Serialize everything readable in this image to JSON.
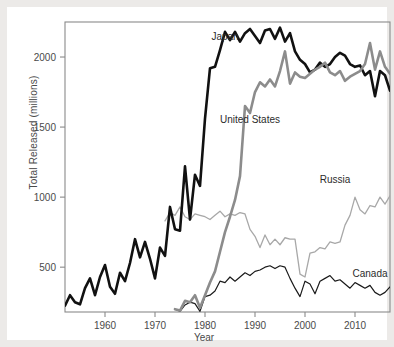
{
  "chart_data": {
    "type": "line",
    "title": "",
    "xlabel": "Year",
    "ylabel": "Total Released (millions)",
    "xlim": [
      1952,
      2017
    ],
    "ylim": [
      180,
      2250
    ],
    "xticks": [
      1960,
      1970,
      1980,
      1990,
      2000,
      2010
    ],
    "xtick_labels": [
      "1960",
      "1970",
      "1980",
      "1990",
      "2000",
      "2010"
    ],
    "yticks": [
      500,
      1000,
      1500,
      2000
    ],
    "ytick_labels": [
      "500",
      "1000",
      "1500",
      "2000"
    ],
    "grid": false,
    "legend_position": "inline-annotations",
    "series": [
      {
        "name": "Japan",
        "color": "#111111",
        "width": 2.6,
        "label_x": 1984,
        "label_y": 2120,
        "x": [
          1952,
          1953,
          1954,
          1955,
          1956,
          1957,
          1958,
          1959,
          1960,
          1961,
          1962,
          1963,
          1964,
          1965,
          1966,
          1967,
          1968,
          1969,
          1970,
          1971,
          1972,
          1973,
          1974,
          1975,
          1976,
          1977,
          1978,
          1979,
          1980,
          1981,
          1982,
          1983,
          1984,
          1985,
          1986,
          1987,
          1988,
          1989,
          1990,
          1991,
          1992,
          1993,
          1994,
          1995,
          1996,
          1997,
          1998,
          1999,
          2000,
          2001,
          2002,
          2003,
          2004,
          2005,
          2006,
          2007,
          2008,
          2009,
          2010,
          2011,
          2012,
          2013,
          2014,
          2015,
          2016,
          2017
        ],
        "y": [
          225,
          300,
          250,
          235,
          350,
          420,
          300,
          430,
          515,
          360,
          310,
          460,
          400,
          530,
          700,
          570,
          680,
          560,
          420,
          640,
          580,
          930,
          770,
          760,
          1220,
          840,
          1160,
          1080,
          1560,
          1920,
          1930,
          2050,
          2180,
          2120,
          2180,
          2110,
          2170,
          2200,
          2150,
          2100,
          2190,
          2200,
          2130,
          2210,
          2110,
          2170,
          2040,
          1980,
          1950,
          1890,
          1910,
          1960,
          1930,
          1950,
          2000,
          2030,
          2010,
          1950,
          1930,
          1940,
          1870,
          1900,
          1720,
          1900,
          1870,
          1760
        ]
      },
      {
        "name": "United States",
        "color": "#8c8c8c",
        "width": 2.6,
        "label_x": 1989,
        "label_y": 1530,
        "x": [
          1974,
          1975,
          1976,
          1977,
          1978,
          1979,
          1980,
          1981,
          1982,
          1983,
          1984,
          1985,
          1986,
          1987,
          1988,
          1989,
          1990,
          1991,
          1992,
          1993,
          1994,
          1995,
          1996,
          1997,
          1998,
          1999,
          2000,
          2001,
          2002,
          2003,
          2004,
          2005,
          2006,
          2007,
          2008,
          2009,
          2010,
          2011,
          2012,
          2013,
          2014,
          2015,
          2016,
          2017
        ],
        "y": [
          200,
          190,
          260,
          250,
          300,
          210,
          300,
          390,
          470,
          610,
          750,
          860,
          980,
          1150,
          1650,
          1600,
          1750,
          1820,
          1790,
          1840,
          1790,
          1900,
          2040,
          1810,
          1890,
          1860,
          1850,
          1880,
          1910,
          1930,
          1960,
          1890,
          1870,
          1900,
          1830,
          1860,
          1880,
          1900,
          1950,
          2100,
          1910,
          2040,
          1930,
          1880
        ]
      },
      {
        "name": "Russia",
        "color": "#a8a8a8",
        "width": 1.3,
        "label_x": 2006,
        "label_y": 1100,
        "x": [
          1972,
          1973,
          1974,
          1975,
          1976,
          1977,
          1978,
          1979,
          1980,
          1981,
          1982,
          1983,
          1984,
          1985,
          1986,
          1987,
          1988,
          1989,
          1990,
          1991,
          1992,
          1993,
          1994,
          1995,
          1996,
          1997,
          1998,
          1999,
          2000,
          2001,
          2002,
          2003,
          2004,
          2005,
          2006,
          2007,
          2008,
          2009,
          2010,
          2011,
          2012,
          2013,
          2014,
          2015,
          2016,
          2017
        ],
        "y": [
          830,
          890,
          870,
          930,
          860,
          840,
          880,
          870,
          860,
          840,
          870,
          900,
          860,
          880,
          870,
          890,
          880,
          770,
          720,
          640,
          730,
          660,
          700,
          660,
          710,
          700,
          700,
          450,
          430,
          600,
          610,
          640,
          630,
          680,
          670,
          680,
          800,
          870,
          1000,
          910,
          880,
          940,
          930,
          1000,
          950,
          1010
        ]
      },
      {
        "name": "Canada",
        "color": "#1a1a1a",
        "width": 1.2,
        "label_x": 2013,
        "label_y": 430,
        "x": [
          1974,
          1975,
          1976,
          1977,
          1978,
          1979,
          1980,
          1981,
          1982,
          1983,
          1984,
          1985,
          1986,
          1987,
          1988,
          1989,
          1990,
          1991,
          1992,
          1993,
          1994,
          1995,
          1996,
          1997,
          1998,
          1999,
          2000,
          2001,
          2002,
          2003,
          2004,
          2005,
          2006,
          2007,
          2008,
          2009,
          2010,
          2011,
          2012,
          2013,
          2014,
          2015,
          2016,
          2017
        ],
        "y": [
          200,
          185,
          230,
          250,
          240,
          185,
          290,
          300,
          330,
          400,
          390,
          430,
          400,
          430,
          460,
          440,
          470,
          480,
          500,
          510,
          490,
          510,
          500,
          420,
          350,
          290,
          400,
          380,
          310,
          400,
          420,
          440,
          400,
          410,
          380,
          350,
          390,
          370,
          350,
          370,
          320,
          300,
          320,
          360
        ]
      }
    ]
  }
}
